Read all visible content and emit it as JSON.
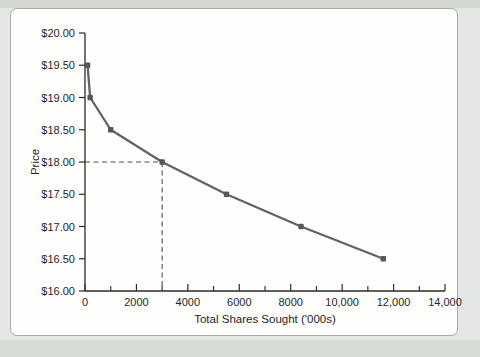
{
  "figure": {
    "colors": {
      "background": "#e4e7e3",
      "band_dark": "#d2d7d1",
      "band_dark2": "#d7dcd6",
      "panel_background": "#fefefc",
      "panel_border": "#a9ada8",
      "line": "#626265",
      "marker": "#57575a",
      "axis": "#2a2a2a",
      "text": "#1f1f1f",
      "guide": "#4c4c4c"
    }
  },
  "chart_data": {
    "type": "line",
    "title": "",
    "xlabel": "Total Shares Sought ('000s)",
    "ylabel": "Price",
    "series": [
      {
        "name": "price-demand-curve",
        "x": [
          100,
          200,
          1000,
          3000,
          5500,
          8400,
          11600
        ],
        "y": [
          19.5,
          19.0,
          18.5,
          18.0,
          17.5,
          17.0,
          16.5
        ]
      }
    ],
    "xlim": [
      0,
      14000
    ],
    "ylim": [
      16.0,
      20.0
    ],
    "x_major_ticks": [
      0,
      2000,
      4000,
      6000,
      8000,
      10000,
      12000,
      14000
    ],
    "x_major_tick_labels": [
      "0",
      "2000",
      "4000",
      "6000",
      "8000",
      "10,000",
      "12,000",
      "14,000"
    ],
    "x_minor_ticks": [
      1000,
      3000,
      5000,
      7000,
      9000,
      11000,
      13000
    ],
    "y_ticks": [
      16.0,
      16.5,
      17.0,
      17.5,
      18.0,
      18.5,
      19.0,
      19.5,
      20.0
    ],
    "y_tick_labels": [
      "$16.00",
      "$16.50",
      "$17.00",
      "$17.50",
      "$18.00",
      "$18.50",
      "$19.00",
      "$19.50",
      "$20.00"
    ],
    "guide_lines": [
      {
        "x": 3000,
        "y": 18.0,
        "style": "dashed"
      }
    ],
    "grid": false,
    "legend": "none"
  }
}
